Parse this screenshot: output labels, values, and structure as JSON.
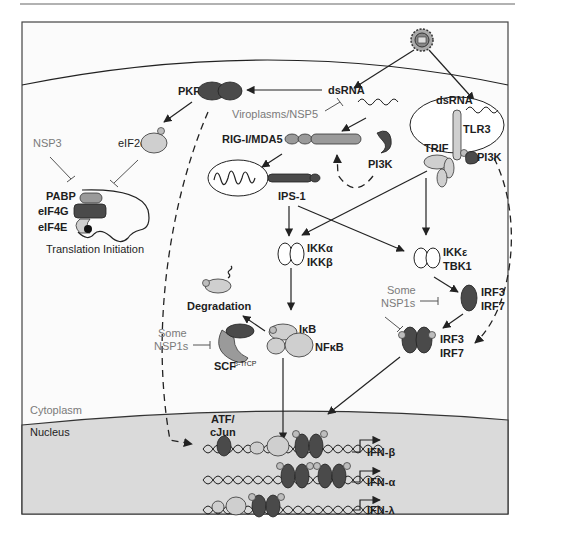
{
  "figure": {
    "compartments": {
      "cytoplasm": "Cytoplasm",
      "nucleus": "Nucleus"
    },
    "colors": {
      "nucleus_fill": "#dadada",
      "cytoplasm_fill": "#f7f7f7",
      "dark_protein": "#4a4a4a",
      "mid_protein": "#9a9a9a",
      "light_protein": "#cfcfcf"
    },
    "icons": {
      "virus": "virus-icon",
      "mitochondrion": "mitochondrion-icon",
      "endosome": "endosome-icon",
      "dna": "dna-helix-icon",
      "phosphate": "phosphate-icon"
    },
    "labels": {
      "pkr": "PKR",
      "dsrna_cyto": "dsRNA",
      "viroplasms": "Viroplasms/NSP5",
      "dsrna_endo": "dsRNA",
      "tlr3": "TLR3",
      "trif": "TRIF",
      "pi3k_endo": "PI3K",
      "rig_mda5": "RIG-I/MDA5",
      "pi3k_cyto": "PI3K",
      "ips1": "IPS-1",
      "eif2a": "eIF2α",
      "nsp3": "NSP3",
      "pabp": "PABP",
      "eif4g": "eIF4G",
      "eif4e": "eIF4E",
      "translation": "Translation Initiation",
      "ikka": "IKKα",
      "ikkb": "IKKβ",
      "ikke": "IKKε",
      "tbk1": "TBK1",
      "some_nsp1s_right_1": "Some",
      "some_nsp1s_right_2": "NSP1s",
      "irf3_a": "IRF3",
      "irf7_a": "IRF7",
      "irf3_b": "IRF3",
      "irf7_b": "IRF7",
      "degradation": "Degradation",
      "ikb": "IκB",
      "nfkb": "NFκB",
      "some_nsp1s_left_1": "Some",
      "some_nsp1s_left_2": "NSP1s",
      "scf": "SCF",
      "scf_sup": "β-TrCP",
      "atf": "ATF/",
      "cjun": "cJun",
      "ifn_b": "IFN-β",
      "ifn_a": "IFN-α",
      "ifn_l": "IFN-λ"
    }
  }
}
